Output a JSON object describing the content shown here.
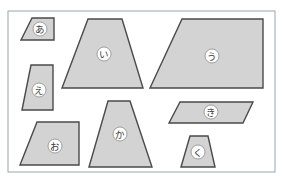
{
  "figure": {
    "title": "",
    "canvas": {
      "width": 283,
      "height": 185
    },
    "board": {
      "x": 8,
      "y": 11,
      "width": 267,
      "height": 161
    },
    "grid": {
      "cell": 11.2,
      "minor_color": "#cfd6e0",
      "major_color": "#b9c2cf",
      "major_every": 5,
      "visible": true
    },
    "style": {
      "shape_fill": "#c9c9c9",
      "shape_stroke": "#4a4a4a",
      "label_disc_fill": "#ffffff",
      "label_disc_stroke": "#8c8c8c",
      "label_text_color": "#3a3a3a",
      "frame_stroke": "#9aa3b0"
    },
    "shapes": [
      {
        "id": "shape-a",
        "label": "あ",
        "kind": "trapezoid",
        "points": "21,40 32,18 54,18 54,40",
        "label_pos": {
          "x": 40,
          "y": 29
        }
      },
      {
        "id": "shape-i",
        "label": "い",
        "kind": "trapezoid",
        "points": "62,88 88,19 122,19 143,88",
        "label_pos": {
          "x": 104,
          "y": 54
        }
      },
      {
        "id": "shape-u",
        "label": "う",
        "kind": "trapezoid",
        "points": "150,88 182,19 263,19 263,88",
        "label_pos": {
          "x": 212,
          "y": 56
        }
      },
      {
        "id": "shape-e",
        "label": "え",
        "kind": "trapezoid",
        "points": "22,110 31,65 53,65 53,110",
        "label_pos": {
          "x": 39,
          "y": 90
        }
      },
      {
        "id": "shape-o",
        "label": "お",
        "kind": "trapezoid",
        "points": "20,165 37,122 79,122 79,165",
        "label_pos": {
          "x": 55,
          "y": 146
        }
      },
      {
        "id": "shape-ka",
        "label": "か",
        "kind": "trapezoid",
        "points": "89,167 108,101 130,101 152,167",
        "label_pos": {
          "x": 120,
          "y": 134
        }
      },
      {
        "id": "shape-ki",
        "label": "き",
        "kind": "trapezoid",
        "points": "169,123 180,102 253,102 243,123",
        "label_pos": {
          "x": 211,
          "y": 112
        }
      },
      {
        "id": "shape-ku",
        "label": "く",
        "kind": "trapezoid",
        "points": "181,167 190,136 208,136 215,167",
        "label_pos": {
          "x": 198,
          "y": 152
        }
      }
    ]
  }
}
